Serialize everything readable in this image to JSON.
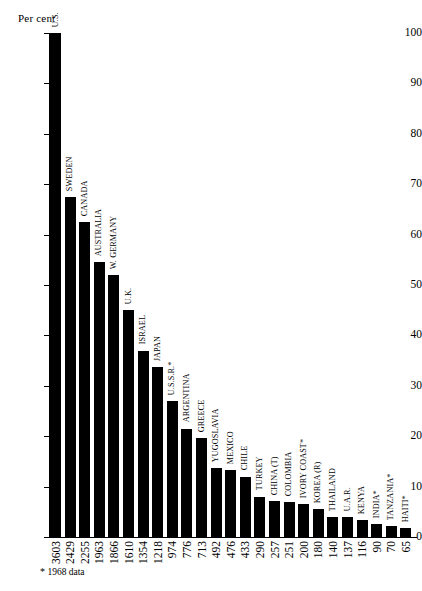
{
  "chart_data": {
    "type": "bar",
    "title": "",
    "subtitle": "",
    "xlabel": "",
    "ylabel": "Per cent",
    "ylim": [
      0,
      100
    ],
    "yticks": [
      0,
      10,
      20,
      30,
      40,
      50,
      60,
      70,
      80,
      90,
      100
    ],
    "grid": false,
    "legend": null,
    "bar_color": "#000000",
    "orientation": "vertical",
    "annotation": "* 1968 data",
    "categories": [
      "U.S.",
      "SWEDEN",
      "CANADA",
      "AUSTRALIA",
      "W. GERMANY",
      "U.K.",
      "ISRAEL",
      "JAPAN",
      "U.S.S.R.*",
      "ARGENTINA",
      "GREECE",
      "YUGOSLAVIA",
      "MEXICO",
      "CHILE",
      "TURKEY",
      "CHINA (T)",
      "COLOMBIA",
      "IVORY COAST*",
      "KOREA (R)",
      "THAILAND",
      "U.A.R.",
      "KENYA",
      "INDIA*",
      "TANZANIA*",
      "HAITI*"
    ],
    "values": [
      100,
      67.5,
      62.5,
      54.5,
      52,
      45,
      37,
      33.7,
      27,
      21.5,
      19.7,
      13.7,
      13.2,
      12,
      8,
      7.2,
      7,
      6.5,
      5.5,
      4,
      3.9,
      3.3,
      2.6,
      2.2,
      1.8
    ],
    "tick_numbers": [
      "3603",
      "2429",
      "2255",
      "1963",
      "1866",
      "1610",
      "1354",
      "1218",
      "974",
      "776",
      "713",
      "492",
      "476",
      "433",
      "290",
      "257",
      "251",
      "200",
      "180",
      "140",
      "137",
      "116",
      "90",
      "70",
      "65"
    ]
  }
}
